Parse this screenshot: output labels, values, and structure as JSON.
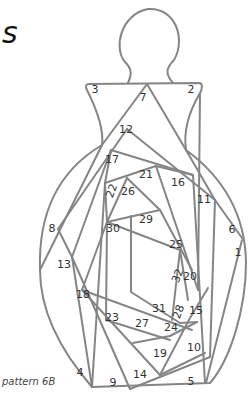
{
  "heading_fragment": "s",
  "caption": "pattern 6B",
  "diagram": {
    "type": "iris-folding pattern",
    "shape": "bottle / vase",
    "line_color": "#858585",
    "labels": [
      {
        "n": "1",
        "x": 238,
        "y": 256
      },
      {
        "n": "2",
        "x": 191,
        "y": 93
      },
      {
        "n": "3",
        "x": 95,
        "y": 93
      },
      {
        "n": "4",
        "x": 80,
        "y": 376
      },
      {
        "n": "5",
        "x": 191,
        "y": 385
      },
      {
        "n": "6",
        "x": 232,
        "y": 233
      },
      {
        "n": "7",
        "x": 143,
        "y": 101
      },
      {
        "n": "8",
        "x": 52,
        "y": 232
      },
      {
        "n": "9",
        "x": 113,
        "y": 386
      },
      {
        "n": "10",
        "x": 194,
        "y": 351
      },
      {
        "n": "11",
        "x": 204,
        "y": 203
      },
      {
        "n": "12",
        "x": 126,
        "y": 133
      },
      {
        "n": "13",
        "x": 64,
        "y": 268
      },
      {
        "n": "14",
        "x": 140,
        "y": 378
      },
      {
        "n": "15",
        "x": 196,
        "y": 314
      },
      {
        "n": "16",
        "x": 178,
        "y": 186
      },
      {
        "n": "17",
        "x": 112,
        "y": 163
      },
      {
        "n": "18",
        "x": 83,
        "y": 298
      },
      {
        "n": "19",
        "x": 160,
        "y": 357
      },
      {
        "n": "20",
        "x": 190,
        "y": 280
      },
      {
        "n": "21",
        "x": 146,
        "y": 178
      },
      {
        "n": "22",
        "x": 115,
        "y": 192,
        "rotated": true
      },
      {
        "n": "23",
        "x": 112,
        "y": 321
      },
      {
        "n": "24",
        "x": 171,
        "y": 331
      },
      {
        "n": "25",
        "x": 176,
        "y": 248
      },
      {
        "n": "26",
        "x": 128,
        "y": 195
      },
      {
        "n": "27",
        "x": 142,
        "y": 327
      },
      {
        "n": "28",
        "x": 182,
        "y": 313,
        "rotated": true
      },
      {
        "n": "29",
        "x": 146,
        "y": 223
      },
      {
        "n": "30",
        "x": 113,
        "y": 232
      },
      {
        "n": "31",
        "x": 159,
        "y": 312
      },
      {
        "n": "32",
        "x": 181,
        "y": 277,
        "rotated": true
      }
    ]
  }
}
